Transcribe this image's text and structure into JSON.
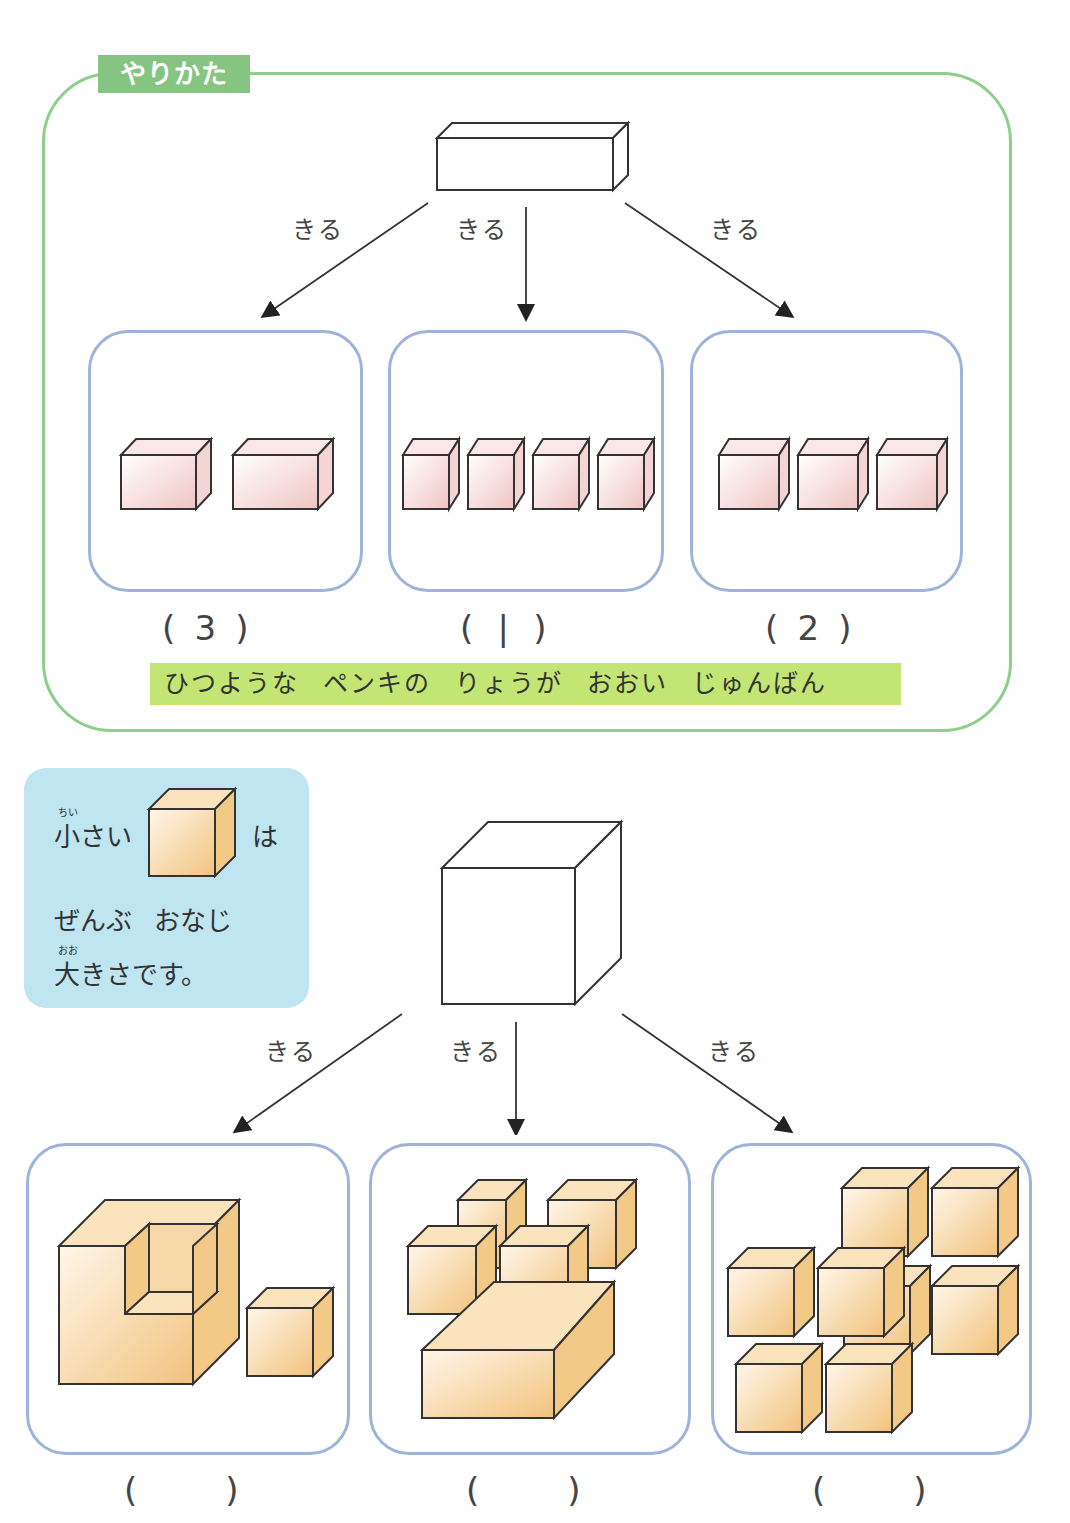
{
  "example": {
    "tab_label": "やりかた",
    "cut_labels": [
      "きる",
      "きる",
      "きる"
    ],
    "answers": [
      {
        "open": "(",
        "value": "3",
        "close": ")"
      },
      {
        "open": "(",
        "value": "|",
        "close": ")"
      },
      {
        "open": "(",
        "value": "2",
        "close": ")"
      }
    ],
    "piece_counts": [
      2,
      4,
      3
    ],
    "note": "ひつような ペンキの りょうが おおい じゅんばん",
    "colors": {
      "frame": "#8ccf8a",
      "tab": "#86c481",
      "note_bg": "#c3e574",
      "panel_border": "#9fb3da",
      "piece_fill": "#f4cfcf"
    }
  },
  "hint": {
    "ruby_small": "ちい",
    "line1_start": "小さい",
    "line1_end": "は",
    "line2": "ぜんぶ おなじ",
    "ruby_large": "おお",
    "line3": "大きさです。",
    "colors": {
      "bg": "#bfe6f0",
      "cube_fill": "#f7d29a"
    }
  },
  "problem": {
    "cut_labels": [
      "きる",
      "きる",
      "きる"
    ],
    "answers": [
      {
        "open": "(",
        "value": "",
        "close": ")"
      },
      {
        "open": "(",
        "value": "",
        "close": ")"
      },
      {
        "open": "(",
        "value": "",
        "close": ")"
      }
    ]
  }
}
